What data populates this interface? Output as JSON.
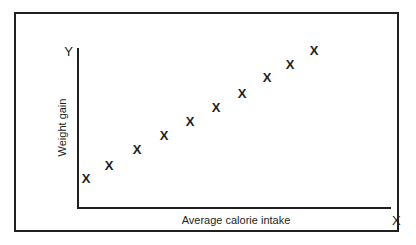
{
  "figure": {
    "border_color": "#231f20",
    "background": "#ffffff"
  },
  "axes": {
    "y_marker": "Y",
    "x_marker": "X",
    "y_title": "Weight gain",
    "x_title": "Average calorie intake"
  },
  "chart_data": {
    "type": "scatter",
    "title": "",
    "xlabel": "Average calorie intake",
    "ylabel": "Weight gain",
    "xlim": [
      0,
      10
    ],
    "ylim": [
      0,
      10
    ],
    "grid": false,
    "legend": null,
    "marker": "X",
    "axis_end_labels": {
      "x": "X",
      "y": "Y"
    },
    "point_count": 10,
    "points": [
      {
        "label": "X",
        "x": 0.8,
        "y": 0.6,
        "px": 84,
        "py": 176
      },
      {
        "label": "X",
        "x": 1.5,
        "y": 1.4,
        "px": 107,
        "py": 163
      },
      {
        "label": "X",
        "x": 2.4,
        "y": 2.4,
        "px": 135,
        "py": 147
      },
      {
        "label": "X",
        "x": 3.2,
        "y": 3.3,
        "px": 162,
        "py": 133
      },
      {
        "label": "X",
        "x": 4.0,
        "y": 4.2,
        "px": 188,
        "py": 119
      },
      {
        "label": "X",
        "x": 4.9,
        "y": 5.1,
        "px": 214,
        "py": 105
      },
      {
        "label": "X",
        "x": 5.7,
        "y": 6.0,
        "px": 240,
        "py": 91
      },
      {
        "label": "X",
        "x": 6.5,
        "y": 7.0,
        "px": 265,
        "py": 75
      },
      {
        "label": "X",
        "x": 7.3,
        "y": 7.8,
        "px": 288,
        "py": 62
      },
      {
        "label": "X",
        "x": 8.2,
        "y": 8.8,
        "px": 312,
        "py": 48
      }
    ]
  }
}
